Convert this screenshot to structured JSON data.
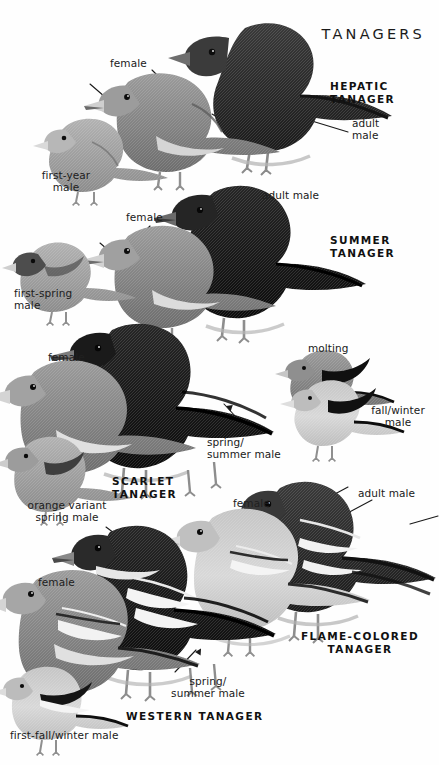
{
  "plate": {
    "title": "TANAGERS",
    "page_background": "#ffffff",
    "ink_color": "#1a1a1a",
    "style": "grayscale field-guide illustration plate"
  },
  "species": [
    {
      "name": "HEPATIC\nTANAGER",
      "name_pos": {
        "x": 330,
        "y": 80
      },
      "align": "left",
      "labels": [
        {
          "text": "female",
          "x": 110,
          "y": 58,
          "align": "left",
          "leader": true
        },
        {
          "text": "first-year\nmale",
          "x": 28,
          "y": 170,
          "align": "center",
          "leader": false
        },
        {
          "text": "adult\nmale",
          "x": 352,
          "y": 118,
          "align": "left",
          "leader": true
        }
      ]
    },
    {
      "name": "SUMMER\nTANAGER",
      "name_pos": {
        "x": 330,
        "y": 234
      },
      "align": "left",
      "labels": [
        {
          "text": "adult male",
          "x": 262,
          "y": 190,
          "align": "left",
          "leader": false
        },
        {
          "text": "female",
          "x": 126,
          "y": 212,
          "align": "left",
          "leader": true
        },
        {
          "text": "first-spring\nmale",
          "x": 14,
          "y": 288,
          "align": "left",
          "leader": false
        }
      ]
    },
    {
      "name": "SCARLET\nTANAGER",
      "name_pos": {
        "x": 112,
        "y": 475
      },
      "align": "left",
      "labels": [
        {
          "text": "female",
          "x": 48,
          "y": 352,
          "align": "left",
          "leader": true
        },
        {
          "text": "orange variant\nspring male",
          "x": 17,
          "y": 500,
          "align": "left",
          "leader": false
        },
        {
          "text": "spring/\nsummer male",
          "x": 207,
          "y": 437,
          "align": "left",
          "leader": true
        },
        {
          "text": "molting",
          "x": 308,
          "y": 343,
          "align": "left",
          "leader": false
        },
        {
          "text": "fall/winter\nmale",
          "x": 362,
          "y": 405,
          "align": "left",
          "leader": false
        }
      ]
    },
    {
      "name": "FLAME-COLORED\nTANAGER",
      "name_pos": {
        "x": 307,
        "y": 630
      },
      "align": "left",
      "labels": [
        {
          "text": "female",
          "x": 233,
          "y": 498,
          "align": "left",
          "leader": true
        },
        {
          "text": "adult male",
          "x": 358,
          "y": 488,
          "align": "left",
          "leader": true
        }
      ]
    },
    {
      "name": "WESTERN TANAGER",
      "name_pos": {
        "x": 126,
        "y": 710
      },
      "align": "left",
      "labels": [
        {
          "text": "female",
          "x": 38,
          "y": 577,
          "align": "left",
          "leader": true
        },
        {
          "text": "spring/\nsummer male",
          "x": 160,
          "y": 676,
          "align": "left",
          "leader": true
        },
        {
          "text": "first-fall/winter male",
          "x": 10,
          "y": 730,
          "align": "left",
          "leader": false
        }
      ]
    }
  ],
  "colors": {
    "ink": "#1a1a1a",
    "dark_plumage": "#2b2b2b",
    "black_plumage": "#121212",
    "mid_plumage": "#8a8a8a",
    "light_plumage": "#c9c9c9",
    "pale_belly": "#dedede",
    "leg": "#8f8f8f",
    "branch": "#9a9a9a"
  }
}
